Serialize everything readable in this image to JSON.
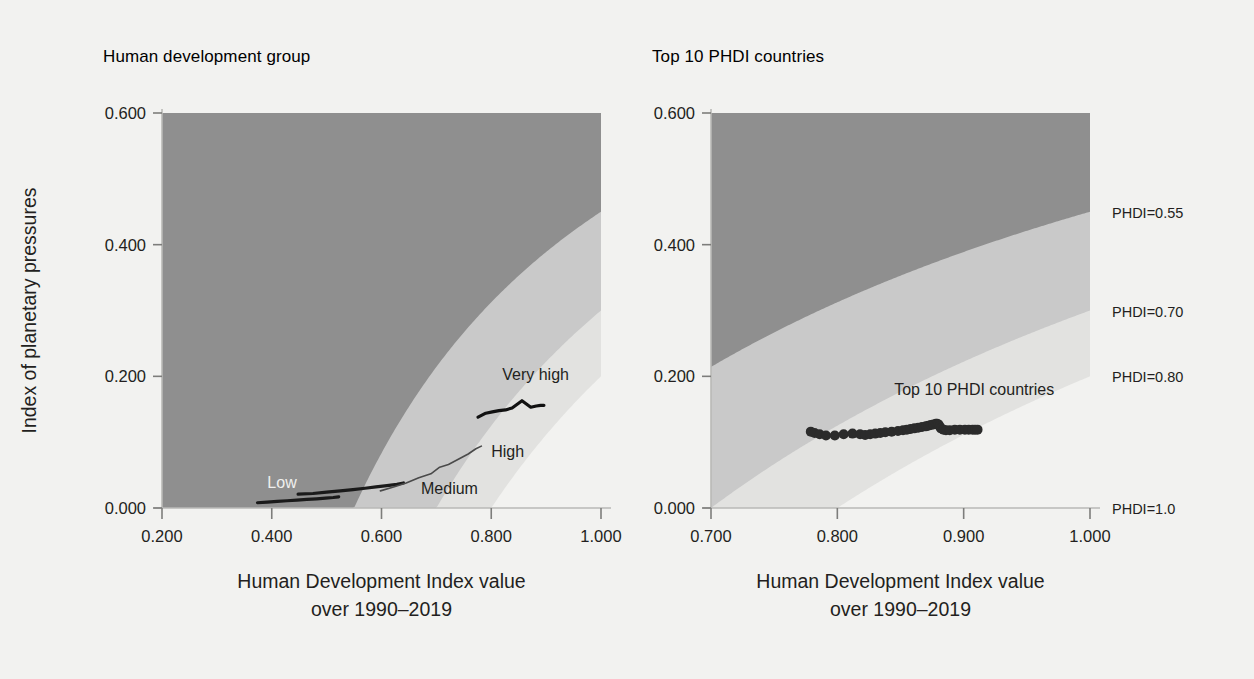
{
  "figure": {
    "background_color": "#f2f2f0",
    "text_color": "#231f20",
    "band_colors": [
      "#8f8f8f",
      "#c9c9c9",
      "#e2e2e0",
      "#f2f2f0",
      "#3a3a3a"
    ],
    "series_color": "#1a1a1a"
  },
  "panels": [
    {
      "id": "left",
      "title": "Human development group",
      "ylabel": "Index of planetary pressures",
      "xlabel_line1": "Human Development Index value",
      "xlabel_line2": "over 1990–2019",
      "yticks": [
        "0.000",
        "0.200",
        "0.400",
        "0.600"
      ],
      "xticks": [
        "0.200",
        "0.400",
        "0.600",
        "0.800",
        "1.000"
      ],
      "series_labels": [
        "Low",
        "Medium",
        "High",
        "Very high"
      ]
    },
    {
      "id": "right",
      "title": "Top 10 PHDI countries",
      "xlabel_line1": "Human Development Index value",
      "xlabel_line2": "over 1990–2019",
      "yticks": [
        "0.000",
        "0.200",
        "0.400",
        "0.600"
      ],
      "xticks": [
        "0.700",
        "0.800",
        "0.900",
        "1.000"
      ],
      "series_labels": [
        "Top 10 PHDI countries"
      ],
      "phdi_labels": [
        "PHDI=0.55",
        "PHDI=0.70",
        "PHDI=0.80",
        "PHDI=1.0"
      ]
    }
  ],
  "chart_data": [
    {
      "type": "line",
      "panel": "left",
      "title": "Human development group",
      "xlabel": "Human Development Index value over 1990–2019",
      "ylabel": "Index of planetary pressures",
      "xlim": [
        0.2,
        1.0
      ],
      "ylim": [
        0.0,
        0.6
      ],
      "xticks": [
        0.2,
        0.4,
        0.6,
        0.8,
        1.0
      ],
      "yticks": [
        0.0,
        0.2,
        0.4,
        0.6
      ],
      "grid": false,
      "legend_position": "inline-annotations",
      "background_bands": {
        "description": "Iso-PHDI contour bands; PHDI = HDI * (1 - index of planetary pressures)",
        "levels": [
          0.55,
          0.7,
          0.8,
          1.0
        ],
        "colors": [
          "#8f8f8f",
          "#c9c9c9",
          "#e2e2e0",
          "#f2f2f0",
          "#3a3a3a"
        ]
      },
      "series": [
        {
          "name": "Low",
          "label": "Low",
          "color": "#1a1a1a",
          "x": [
            0.374,
            0.392,
            0.41,
            0.428,
            0.446,
            0.464,
            0.482,
            0.498,
            0.512,
            0.522
          ],
          "y": [
            0.008,
            0.009,
            0.01,
            0.011,
            0.012,
            0.013,
            0.014,
            0.015,
            0.016,
            0.017
          ]
        },
        {
          "name": "Medium",
          "label": "Medium",
          "color": "#1a1a1a",
          "x": [
            0.448,
            0.475,
            0.5,
            0.525,
            0.548,
            0.57,
            0.59,
            0.61,
            0.628,
            0.64
          ],
          "y": [
            0.021,
            0.022,
            0.024,
            0.026,
            0.028,
            0.03,
            0.032,
            0.034,
            0.036,
            0.038
          ]
        },
        {
          "name": "High",
          "label": "High",
          "color": "#4a4a4a",
          "x": [
            0.598,
            0.622,
            0.645,
            0.668,
            0.69,
            0.706,
            0.722,
            0.74,
            0.758,
            0.772,
            0.782
          ],
          "y": [
            0.026,
            0.032,
            0.038,
            0.046,
            0.052,
            0.062,
            0.066,
            0.074,
            0.082,
            0.09,
            0.094
          ]
        },
        {
          "name": "Very high",
          "label": "Very high",
          "color": "#111111",
          "x": [
            0.776,
            0.79,
            0.802,
            0.814,
            0.826,
            0.838,
            0.848,
            0.856,
            0.864,
            0.872,
            0.882,
            0.89,
            0.896
          ],
          "y": [
            0.138,
            0.144,
            0.146,
            0.148,
            0.149,
            0.152,
            0.158,
            0.163,
            0.158,
            0.153,
            0.155,
            0.156,
            0.156
          ]
        }
      ]
    },
    {
      "type": "scatter",
      "panel": "right",
      "title": "Top 10 PHDI countries",
      "xlabel": "Human Development Index value over 1990–2019",
      "ylabel": "Index of planetary pressures",
      "xlim": [
        0.7,
        1.0
      ],
      "ylim": [
        0.0,
        0.6
      ],
      "xticks": [
        0.7,
        0.8,
        0.9,
        1.0
      ],
      "yticks": [
        0.0,
        0.2,
        0.4,
        0.6
      ],
      "grid": false,
      "legend_position": "inline-annotation",
      "background_bands": {
        "description": "Iso-PHDI contour bands; PHDI = HDI * (1 - index of planetary pressures)",
        "levels": [
          0.55,
          0.7,
          0.8,
          1.0
        ],
        "colors": [
          "#8f8f8f",
          "#c9c9c9",
          "#e2e2e0",
          "#f2f2f0",
          "#3a3a3a"
        ]
      },
      "series": [
        {
          "name": "Top 10 PHDI countries",
          "label": "Top 10 PHDI countries",
          "color": "#2b2b2b",
          "marker": "circle",
          "x": [
            0.779,
            0.782,
            0.786,
            0.791,
            0.798,
            0.805,
            0.812,
            0.818,
            0.822,
            0.826,
            0.83,
            0.834,
            0.838,
            0.843,
            0.848,
            0.852,
            0.855,
            0.858,
            0.861,
            0.864,
            0.867,
            0.87,
            0.872,
            0.874,
            0.876,
            0.878,
            0.879,
            0.88,
            0.881,
            0.882,
            0.884,
            0.886,
            0.889,
            0.893,
            0.897,
            0.901,
            0.904,
            0.907,
            0.909,
            0.911
          ],
          "y": [
            0.116,
            0.114,
            0.112,
            0.11,
            0.11,
            0.112,
            0.113,
            0.112,
            0.111,
            0.112,
            0.113,
            0.114,
            0.115,
            0.116,
            0.117,
            0.118,
            0.119,
            0.12,
            0.121,
            0.122,
            0.123,
            0.124,
            0.125,
            0.126,
            0.127,
            0.128,
            0.128,
            0.127,
            0.124,
            0.121,
            0.119,
            0.118,
            0.118,
            0.119,
            0.119,
            0.119,
            0.119,
            0.119,
            0.119,
            0.119
          ]
        }
      ]
    }
  ]
}
